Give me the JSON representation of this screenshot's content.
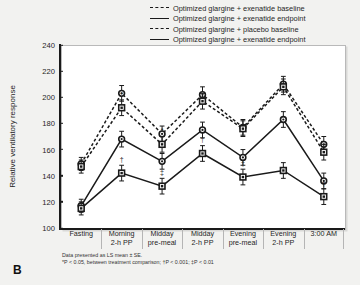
{
  "panel": {
    "label": "B"
  },
  "legend": {
    "items": [
      {
        "label": "Optimized glargine + exenatide baseline",
        "style": "dashed",
        "marker": "circle"
      },
      {
        "label": "Optimized glargine + exenatide endpoint",
        "style": "solid",
        "marker": "circle"
      },
      {
        "label": "Optimized glargine + placebo baseline",
        "style": "dashed",
        "marker": "square"
      },
      {
        "label": "Optimized glargine + exenatide endpoint",
        "style": "solid",
        "marker": "square"
      }
    ]
  },
  "notes": [
    "Data presented as LS mean ± SE.",
    "*P < 0.05, between treatment comparison; †P < 0.001; ‡P < 0.01"
  ],
  "chart_data": {
    "type": "line",
    "title": "",
    "xlabel": "",
    "ylabel": "Relative ventilatory response",
    "ylim": [
      100,
      240
    ],
    "yticks": [
      100,
      120,
      140,
      160,
      180,
      200,
      220,
      240
    ],
    "grid": false,
    "legend_position": "top-right",
    "categories": [
      [
        "Fasting"
      ],
      [
        "Morning",
        "2-h PP"
      ],
      [
        "Midday",
        "pre-meal"
      ],
      [
        "Midday",
        "2-h PP"
      ],
      [
        "Evening",
        "pre-meal"
      ],
      [
        "Evening",
        "2-h PP"
      ],
      [
        "3:00 AM"
      ]
    ],
    "categories_flat": [
      "Fasting",
      "Morning 2-h PP",
      "Midday pre-meal",
      "Midday 2-h PP",
      "Evening pre-meal",
      "Evening 2-h PP",
      "3:00 AM"
    ],
    "series": [
      {
        "name": "Optimized glargine + exenatide baseline",
        "style": "dashed",
        "marker": "circle",
        "color": "#1a1a1a",
        "values": [
          149,
          203,
          172,
          202,
          177,
          210,
          164
        ],
        "errors": [
          5,
          6,
          6,
          6,
          6,
          6,
          6
        ],
        "annotations": [
          "",
          "",
          "",
          "",
          "",
          "",
          ""
        ]
      },
      {
        "name": "Optimized glargine + placebo baseline",
        "style": "dashed",
        "marker": "square",
        "color": "#1a1a1a",
        "values": [
          147,
          192,
          164,
          197,
          176,
          208,
          158
        ],
        "errors": [
          5,
          6,
          6,
          6,
          6,
          6,
          6
        ],
        "annotations": [
          "",
          "*",
          "*",
          "",
          "",
          "",
          ""
        ]
      },
      {
        "name": "Optimized glargine + exenatide endpoint",
        "style": "solid",
        "marker": "circle",
        "color": "#1a1a1a",
        "values": [
          117,
          168,
          151,
          175,
          154,
          183,
          136
        ],
        "errors": [
          5,
          6,
          6,
          6,
          6,
          6,
          6
        ],
        "annotations": [
          "",
          "",
          "",
          "",
          "",
          "",
          ""
        ]
      },
      {
        "name": "Optimized glargine + exenatide endpoint",
        "style": "solid",
        "marker": "square",
        "color": "#1a1a1a",
        "values": [
          115,
          142,
          132,
          157,
          139,
          144,
          124
        ],
        "errors": [
          5,
          6,
          6,
          6,
          6,
          6,
          6
        ],
        "annotations": [
          "",
          "†",
          "‡",
          "†",
          "†",
          "",
          "†"
        ]
      }
    ]
  }
}
